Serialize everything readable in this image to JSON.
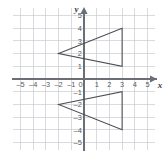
{
  "chart_data": {
    "type": "scatter",
    "title": "",
    "subtitle": "",
    "xlabel": "x",
    "ylabel": "y",
    "xlim": [
      -6,
      6
    ],
    "ylim": [
      -6,
      6
    ],
    "grid": true,
    "legend": "none",
    "x_ticks": [
      "-5",
      "-4",
      "-3",
      "-2",
      "-1",
      "0",
      "1",
      "2",
      "3",
      "4",
      "5"
    ],
    "x_tick_values": [
      -5,
      -4,
      -3,
      -2,
      -1,
      0,
      1,
      2,
      3,
      4,
      5
    ],
    "y_ticks": [
      "5",
      "4",
      "3",
      "2",
      "1",
      "0",
      "-1",
      "-2",
      "-3",
      "-4",
      "-5"
    ],
    "y_tick_values": [
      5,
      4,
      3,
      2,
      1,
      0,
      -1,
      -2,
      -3,
      -4,
      -5
    ],
    "origin_label": "0",
    "annotations": [],
    "series": [
      {
        "name": "upper-triangle",
        "shape": "triangle",
        "closed": true,
        "points": [
          {
            "x": -2,
            "y": 2
          },
          {
            "x": 3,
            "y": 4
          },
          {
            "x": 3,
            "y": 1
          }
        ]
      },
      {
        "name": "lower-triangle",
        "shape": "triangle",
        "closed": true,
        "points": [
          {
            "x": -2,
            "y": -2
          },
          {
            "x": 3,
            "y": -1
          },
          {
            "x": 3,
            "y": -4
          }
        ]
      }
    ]
  },
  "geometry": {
    "origin_px": {
      "x": 84.0,
      "y": 79.0
    },
    "unit_px": 12.7,
    "grid_x_range": [
      -5.6,
      5.6
    ],
    "grid_y_range": [
      -5.6,
      5.6
    ]
  },
  "colors": {
    "background": "#ffffff",
    "grid": "#c9ccd1",
    "axis": "#6b6f75",
    "shape_stroke": "#4a4d52",
    "tick_text": "#55595e",
    "axis_name_text": "#3d4046"
  }
}
